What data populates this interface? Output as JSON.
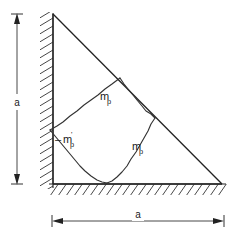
{
  "figure": {
    "type": "engineering-diagram",
    "background_color": "#ffffff",
    "line_color": "#222222",
    "geometry": {
      "apex": [
        53,
        14
      ],
      "bottom_left_corner": [
        53,
        184
      ],
      "bottom_right_corner": [
        222,
        184
      ],
      "yield_vertices": {
        "wall_node": [
          50,
          130
        ],
        "hypotenuse_upper_node": [
          120,
          78
        ],
        "hypotenuse_lower_node": [
          155,
          118
        ],
        "base_node": [
          107,
          183
        ]
      }
    },
    "supports": {
      "left_wall": {
        "name": "fixed-vertical-support",
        "hatch_side": "left",
        "x": 53,
        "y_top": 14,
        "y_bottom": 187
      },
      "bottom_wall": {
        "name": "fixed-horizontal-support",
        "hatch_side": "below",
        "y": 184,
        "x_left": 49,
        "x_right": 226
      }
    },
    "labels": {
      "moment_upper": {
        "symbol": "m",
        "subscript": "p",
        "prime": false,
        "sign": "",
        "x": 100,
        "y": 100
      },
      "moment_negative": {
        "symbol": "m",
        "subscript": "p",
        "prime": true,
        "sign": "–",
        "x": 63,
        "y": 143
      },
      "moment_lower": {
        "symbol": "m",
        "subscript": "p",
        "prime": false,
        "sign": "",
        "x": 132,
        "y": 150
      }
    },
    "dimensions": {
      "vertical": {
        "name": "height-dimension",
        "label": "a",
        "x": 17,
        "y_top": 14,
        "y_bottom": 184,
        "label_x": 17,
        "label_y": 103
      },
      "horizontal": {
        "name": "width-dimension",
        "label": "a",
        "y": 221,
        "x_left": 52,
        "x_right": 224,
        "label_x": 138,
        "label_y": 216
      }
    }
  }
}
